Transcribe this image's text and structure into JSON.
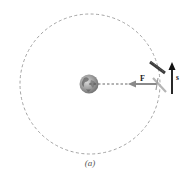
{
  "figure": {
    "caption": "(a)",
    "labels": {
      "force": "F",
      "displacement": "s"
    },
    "elements": {
      "orbit": "dashed circular orbit",
      "planet": "earth-icon",
      "satellite": "satellite-icon",
      "force_arrow": "force vector F pointing toward planet center",
      "displacement_arrow": "displacement vector s tangent to orbit"
    },
    "colors": {
      "orbit": "#9a9a9a",
      "force_arrow": "#8a8a8a",
      "displacement_arrow": "#111111",
      "radius_line": "#555555",
      "satellite_panel": "#444444"
    }
  }
}
